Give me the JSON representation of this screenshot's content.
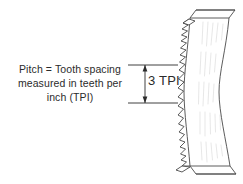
{
  "figure": {
    "background_color": "#ffffff",
    "line_color": "#4a4a4a",
    "text_color": "#2b2b2b",
    "shading_color": "#d8d8d8"
  },
  "caption": {
    "line1": "Pitch = Tooth spacing",
    "line2": "measured in teeth per",
    "line3": "inch (TPI)"
  },
  "dimension": {
    "label": "3 TPI",
    "value": 3,
    "unit": "TPI",
    "teeth_counted": 3
  },
  "blade": {
    "name": "saw-blade",
    "profile": "waisted",
    "tooth_edge": "left",
    "end_caps": [
      "top-bevel",
      "bottom-bevel"
    ]
  }
}
